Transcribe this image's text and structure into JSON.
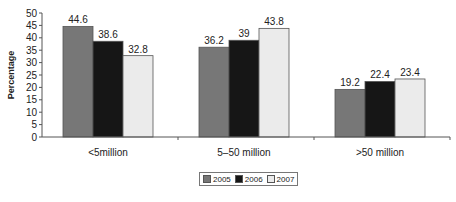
{
  "chart_data": {
    "type": "bar",
    "title": "",
    "xlabel": "",
    "ylabel": "Percentage",
    "ylim": [
      0,
      50
    ],
    "yticks": [
      0,
      5,
      10,
      15,
      20,
      25,
      30,
      35,
      40,
      45,
      50
    ],
    "categories": [
      "<5million",
      "5–50 million",
      ">50 million"
    ],
    "series": [
      {
        "name": "2005",
        "color": "#777777",
        "values": [
          44.6,
          36.2,
          19.2
        ]
      },
      {
        "name": "2006",
        "color": "#161616",
        "values": [
          38.6,
          39,
          22.4
        ]
      },
      {
        "name": "2007",
        "color": "#ebebeb",
        "values": [
          32.8,
          43.8,
          23.4
        ]
      }
    ],
    "data_labels": [
      [
        "44.6",
        "36.2",
        "19.2"
      ],
      [
        "38.6",
        "39",
        "22.4"
      ],
      [
        "32.8",
        "43.8",
        "23.4"
      ]
    ],
    "grid": false,
    "legend_position": "bottom"
  },
  "legend": {
    "items": [
      {
        "label": "2005",
        "color": "#777777"
      },
      {
        "label": "2006",
        "color": "#161616"
      },
      {
        "label": "2007",
        "color": "#ebebeb"
      }
    ]
  }
}
